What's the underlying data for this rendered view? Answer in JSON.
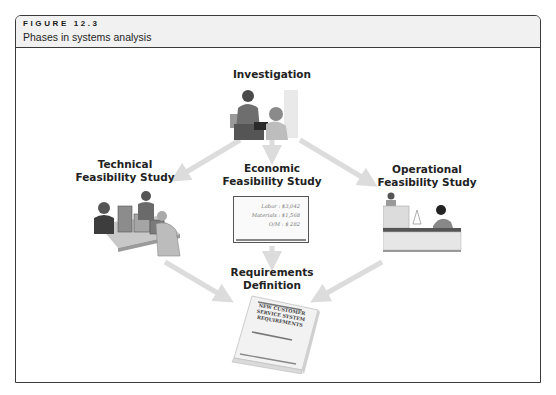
{
  "figure": {
    "number": "FIGURE 12.3",
    "title": "Phases in systems analysis"
  },
  "nodes": {
    "investigation": {
      "label": "Investigation"
    },
    "technical": {
      "label_line1": "Technical",
      "label_line2": "Feasibility Study"
    },
    "economic": {
      "label_line1": "Economic",
      "label_line2": "Feasibility Study",
      "board": {
        "labor": "Labor : $3,042",
        "materials": "Materials : $1,568",
        "om": "O/M : $  282"
      }
    },
    "operational": {
      "label_line1": "Operational",
      "label_line2": "Feasibility Study"
    },
    "requirements": {
      "label_line1": "Requirements",
      "label_line2": "Definition",
      "book": {
        "line1": "NEW CUSTOMER",
        "line2": "SERVICE SYSTEM",
        "line3": "REQUIREMENTS"
      }
    }
  },
  "flow": [
    {
      "from": "Investigation",
      "to": "Technical Feasibility Study"
    },
    {
      "from": "Investigation",
      "to": "Economic Feasibility Study"
    },
    {
      "from": "Investigation",
      "to": "Operational Feasibility Study"
    },
    {
      "from": "Technical Feasibility Study",
      "to": "Requirements Definition"
    },
    {
      "from": "Economic Feasibility Study",
      "to": "Requirements Definition"
    },
    {
      "from": "Operational Feasibility Study",
      "to": "Requirements Definition"
    }
  ],
  "colors": {
    "arrow": "#dcdcdc",
    "frame": "#3a3a3a",
    "header_bg": "#f1f1f1"
  }
}
